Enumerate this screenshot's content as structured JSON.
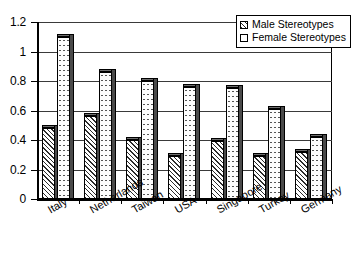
{
  "chart_data": {
    "type": "bar",
    "title": "",
    "xlabel": "",
    "ylabel": "",
    "ylim": [
      0,
      1.2
    ],
    "ytick_labels": [
      "0",
      "0.2",
      "0.4",
      "0.6",
      "0.8",
      "1",
      "1.2"
    ],
    "ytick_values": [
      0,
      0.2,
      0.4,
      0.6,
      0.8,
      1,
      1.2
    ],
    "grid": true,
    "legend_position": "top-right",
    "categories": [
      "Italy",
      "Netherlands",
      "Taiwan",
      "USA",
      "Singapore",
      "Turkey",
      "Germany"
    ],
    "series": [
      {
        "name": "Male Stereotypes",
        "fill": "diagonal-hatch",
        "values": [
          0.48,
          0.56,
          0.4,
          0.29,
          0.39,
          0.29,
          0.32
        ]
      },
      {
        "name": "Female Stereotypes",
        "fill": "dotted",
        "values": [
          1.1,
          0.86,
          0.8,
          0.76,
          0.75,
          0.61,
          0.42
        ]
      }
    ]
  },
  "legend": {
    "items": [
      {
        "label": "Male Stereotypes",
        "swatch": "hatched-square-icon"
      },
      {
        "label": "Female Stereotypes",
        "swatch": "empty-square-icon"
      }
    ]
  }
}
